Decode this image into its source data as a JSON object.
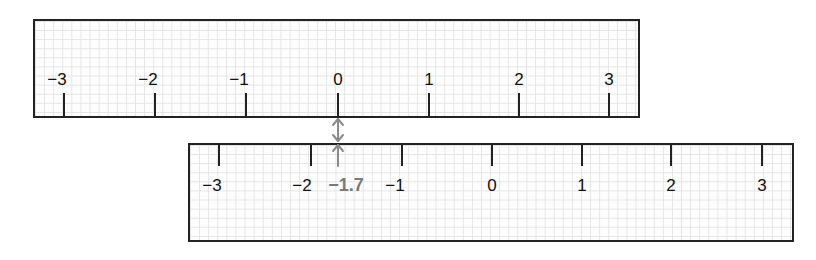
{
  "diagram": {
    "title": "",
    "unit_px": 91,
    "colors": {
      "ruler_border": "#222222",
      "grid": "#e4e4e4",
      "highlight": "#7a7a7a"
    },
    "top_ruler": {
      "ticks": [
        {
          "value": -3,
          "label": "−3"
        },
        {
          "value": -2,
          "label": "−2"
        },
        {
          "value": -1,
          "label": "−1"
        },
        {
          "value": 0,
          "label": "0"
        },
        {
          "value": 1,
          "label": "1"
        },
        {
          "value": 2,
          "label": "2"
        },
        {
          "value": 3,
          "label": "3"
        }
      ]
    },
    "bottom_ruler": {
      "ticks": [
        {
          "value": -3,
          "label": "−3"
        },
        {
          "value": -2,
          "label": "−2"
        },
        {
          "value": -1,
          "label": "−1"
        },
        {
          "value": 0,
          "label": "0"
        },
        {
          "value": 1,
          "label": "1"
        },
        {
          "value": 2,
          "label": "2"
        },
        {
          "value": 3,
          "label": "3"
        }
      ]
    },
    "highlight": {
      "value": -1.7,
      "label": "−1.7",
      "aligned_with_top_value": 0,
      "arrow": "double-headed-arrow"
    }
  }
}
